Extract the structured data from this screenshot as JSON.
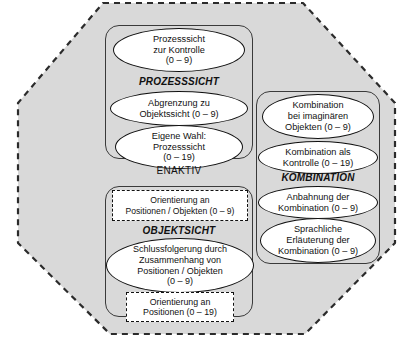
{
  "diagram": {
    "outer_shape_name": "octagon",
    "outer_fill": "#d9d9d9",
    "outer_border": "#2b2b2b",
    "mode_label": "ENAKTIV",
    "groups": [
      {
        "id": "prozesssicht",
        "label": "PROZESSSICHT",
        "nodes": [
          {
            "id": "prozesssicht-kontrolle",
            "text": "Prozesssicht\nzur Kontrolle\n(0 – 9)",
            "shape": "ellipse"
          },
          {
            "id": "abgrenzung-objektsicht",
            "text": "Abgrenzung zu\nObjektssicht (0 – 9)",
            "shape": "ellipse"
          },
          {
            "id": "eigene-wahl-prozesssicht",
            "text": "Eigene Wahl:\nProzesssicht\n(0 – 19)",
            "shape": "ellipse"
          }
        ]
      },
      {
        "id": "objektsicht",
        "label": "OBJEKTSICHT",
        "nodes": [
          {
            "id": "orientierung-positionen-objekten",
            "text": "Orientierung an\nPositionen / Objekten (0 – 9)",
            "shape": "dashed-rect"
          },
          {
            "id": "schlussfolgerung-zusammenhang",
            "text": "Schlussfolgerung durch\nZusammenhang von\nPositionen / Objekten\n(0 – 9)",
            "shape": "ellipse"
          },
          {
            "id": "orientierung-positionen",
            "text": "Orientierung an\nPositionen (0 – 19)",
            "shape": "dashed-rect"
          }
        ]
      },
      {
        "id": "kombination",
        "label": "KOMBINATION",
        "nodes": [
          {
            "id": "kombination-imaginaere-objekte",
            "text": "Kombination\nbei imaginären\nObjekten (0 – 9)",
            "shape": "ellipse"
          },
          {
            "id": "kombination-als-kontrolle",
            "text": "Kombination als\nKontrolle (0 – 19)",
            "shape": "ellipse"
          },
          {
            "id": "anbahnung-kombination",
            "text": "Anbahnung der\nKombination (0 – 9)",
            "shape": "ellipse"
          },
          {
            "id": "sprachliche-erlaeuterung",
            "text": "Sprachliche\nErläuterung der\nKombination (0 – 9)",
            "shape": "ellipse"
          }
        ]
      }
    ]
  }
}
